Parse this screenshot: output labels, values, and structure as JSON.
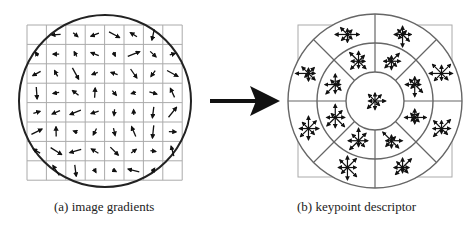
{
  "figure": {
    "panels": [
      {
        "id": "a",
        "caption": "(a) image gradients",
        "grid": {
          "rows": 8,
          "cols": 8
        }
      },
      {
        "id": "b",
        "caption": "(b) keypoint descriptor",
        "rings": 3,
        "sectors_outer": 8,
        "sectors_middle": 8
      }
    ],
    "arrow": "right-arrow",
    "colors": {
      "grid": "#aaaaaa",
      "circle": "#222222",
      "vectors": "#111111",
      "polar_lines": "#666666"
    }
  }
}
